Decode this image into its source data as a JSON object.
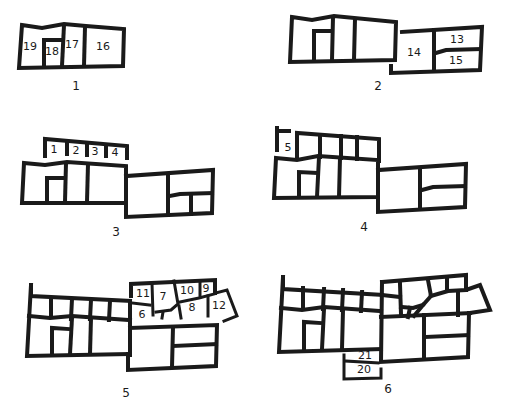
{
  "figure": {
    "ink_color": "#1a1a1a",
    "background": "#ffffff"
  },
  "phases": [
    {
      "label": "1",
      "rooms": [
        "19",
        "18",
        "17",
        "16"
      ]
    },
    {
      "label": "2",
      "rooms": [
        "14",
        "13",
        "15"
      ]
    },
    {
      "label": "3",
      "rooms": [
        "1",
        "2",
        "3",
        "4"
      ]
    },
    {
      "label": "4",
      "rooms": [
        "5"
      ]
    },
    {
      "label": "5",
      "rooms": [
        "11",
        "7",
        "10",
        "9",
        "6",
        "8",
        "12"
      ]
    },
    {
      "label": "6",
      "rooms": [
        "21",
        "20"
      ]
    }
  ]
}
